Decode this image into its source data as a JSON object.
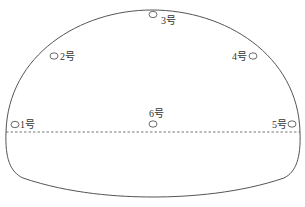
{
  "diagram": {
    "type": "tunnel-cross-section",
    "colors": {
      "outline": "#555555",
      "dashed_line": "#555555",
      "marker": "#444444",
      "text": "#333333"
    },
    "points": [
      {
        "id": "1",
        "label": "1号"
      },
      {
        "id": "2",
        "label": "2号"
      },
      {
        "id": "3",
        "label": "3号"
      },
      {
        "id": "4",
        "label": "4号"
      },
      {
        "id": "5",
        "label": "5号"
      },
      {
        "id": "6",
        "label": "6号"
      }
    ]
  }
}
